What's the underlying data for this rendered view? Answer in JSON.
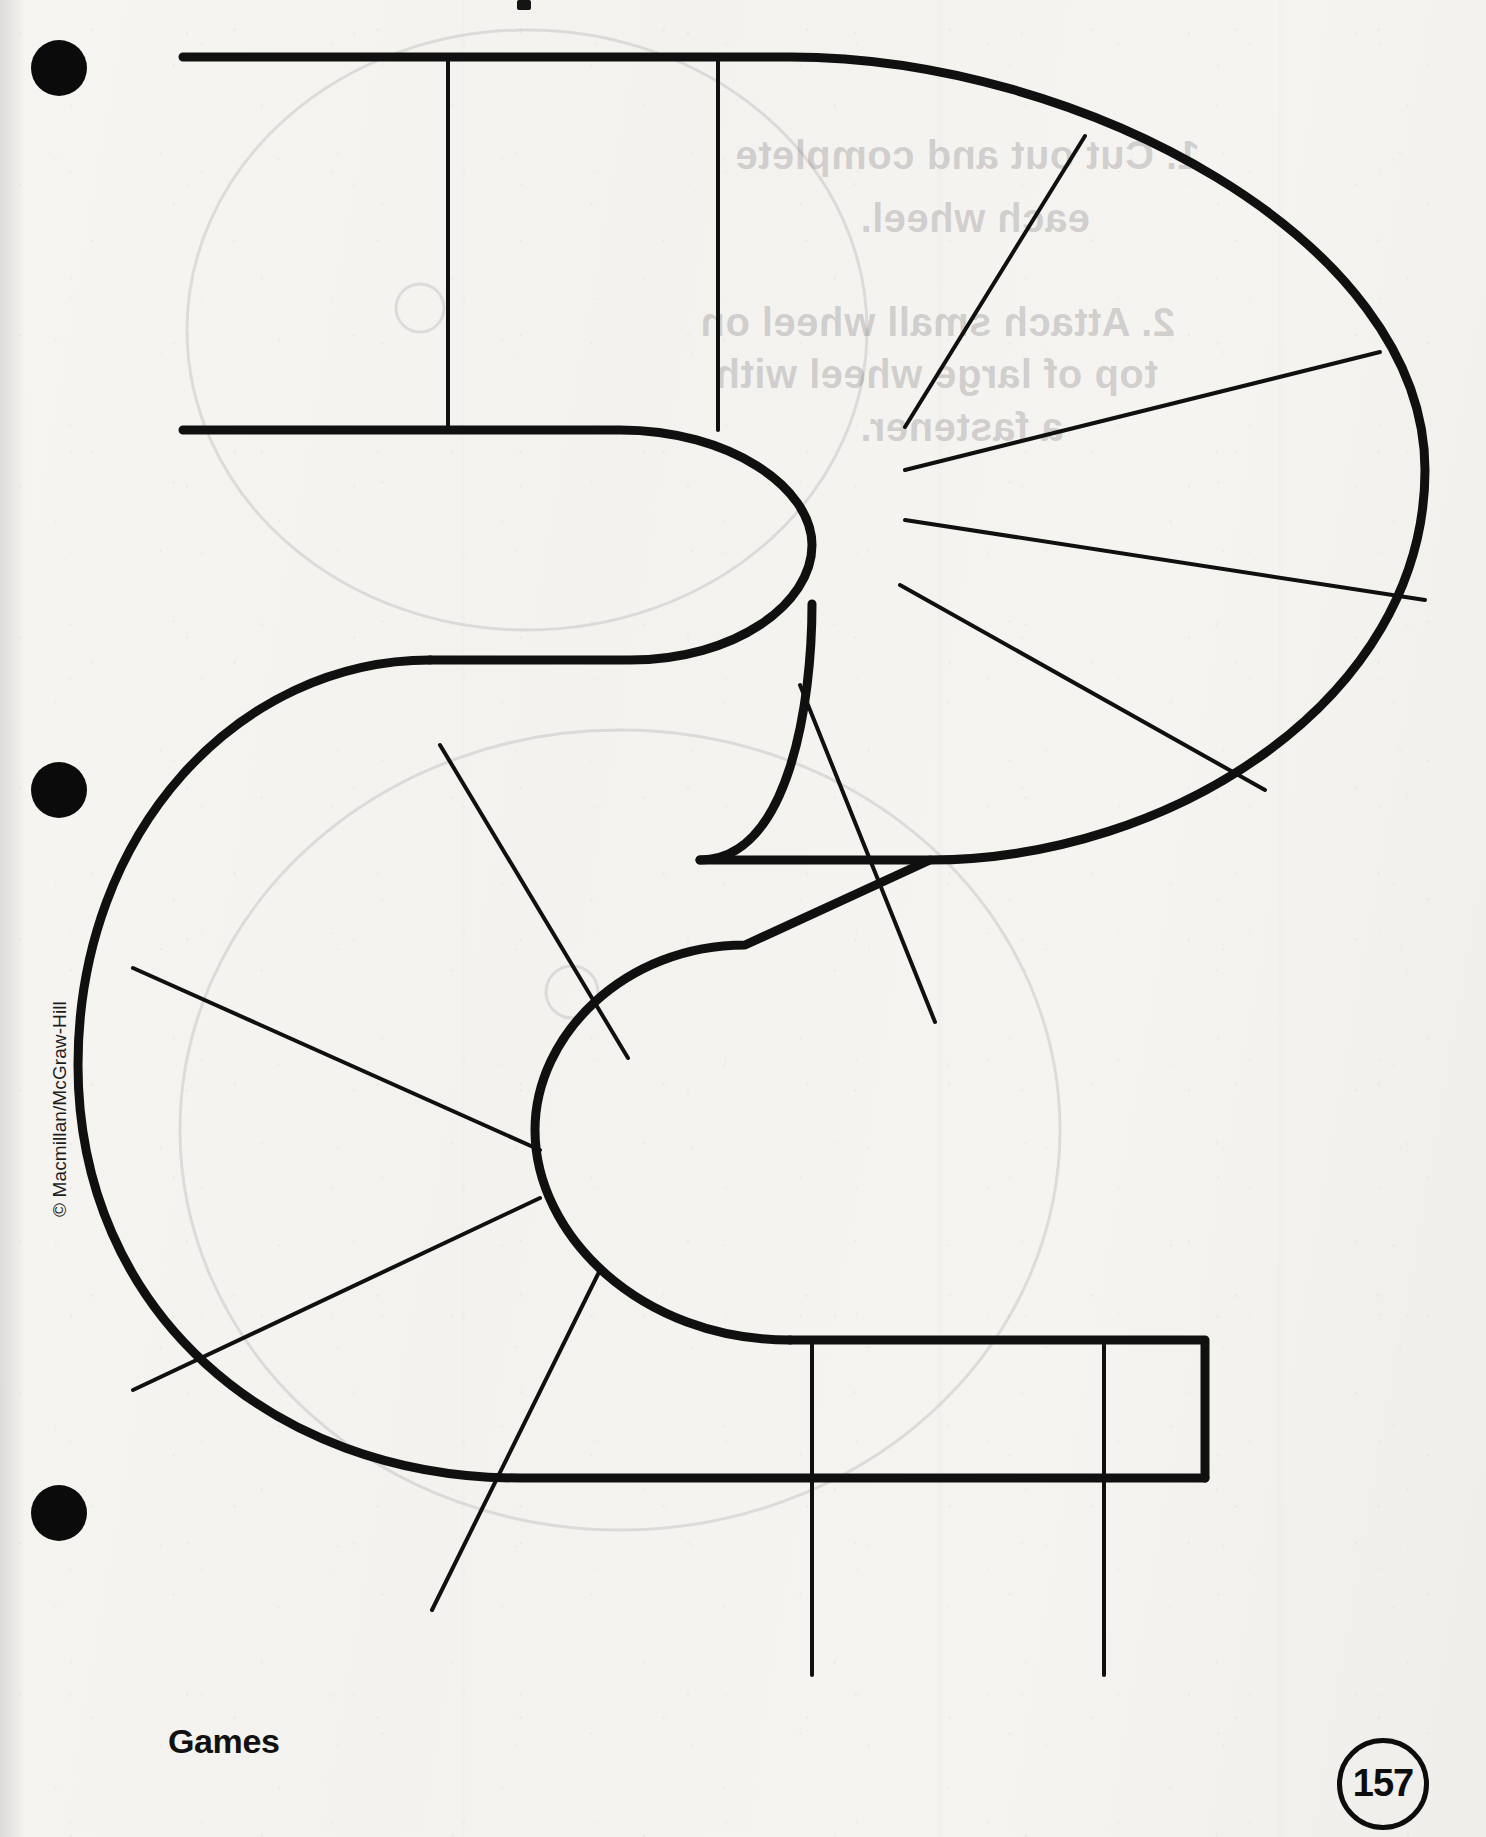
{
  "page": {
    "title": "Games",
    "number": "157",
    "copyright": "© Macmillan/McGraw-Hill",
    "background_color": "#f4f3f0",
    "ink_color": "#111111"
  },
  "footer": {
    "section_label": "Games",
    "page_number": "157"
  },
  "holes": [
    {
      "name": "hole-punch-top",
      "label": "binder hole"
    },
    {
      "name": "hole-punch-middle",
      "label": "binder hole"
    },
    {
      "name": "hole-punch-bottom",
      "label": "binder hole"
    }
  ],
  "artwork": {
    "name": "s-shaped-game-track",
    "description": "Cut-out S-shaped game board track divided into spaces",
    "stroke_color": "#101010",
    "outer_stroke_width": 9,
    "divider_stroke_width": 4,
    "space_count": 16
  },
  "bleed_through_text": {
    "note": "faint mirrored text showing through from the reverse side of the sheet",
    "lines": [
      {
        "text": "1. Cut out and complete",
        "x": 735,
        "y": 133
      },
      {
        "text": "each wheel.",
        "x": 790,
        "y": 196
      },
      {
        "text": "2. Attach small wheel on",
        "x": 700,
        "y": 300
      },
      {
        "text": "top of large wheel with",
        "x": 715,
        "y": 352
      },
      {
        "text": "a fastener.",
        "x": 790,
        "y": 405
      }
    ]
  }
}
